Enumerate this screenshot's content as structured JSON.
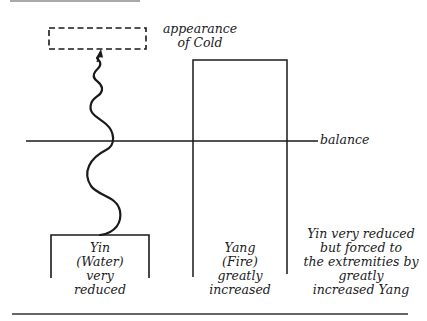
{
  "diagram": {
    "labels": {
      "appearance": [
        "appearance",
        "of Cold"
      ],
      "balance": "balance",
      "yin": [
        "Yin",
        "(Water)",
        "very",
        "reduced"
      ],
      "yang": [
        "Yang",
        "(Fire)",
        "greatly",
        "increased"
      ],
      "note": [
        "Yin very reduced",
        "but forced to",
        "the extremities by",
        "greatly",
        "increased Yang"
      ]
    },
    "elements": {
      "appearance_box": "dashed rectangle",
      "yin_bar": "low open rectangle (very reduced)",
      "yang_bar": "tall open rectangle (greatly increased)",
      "balance_line": "horizontal reference line",
      "wavy_arrow": "wavy line rising from Yin to appearance of Cold"
    },
    "colors": {
      "ink": "#1a1a1a",
      "background": "#ffffff"
    }
  }
}
